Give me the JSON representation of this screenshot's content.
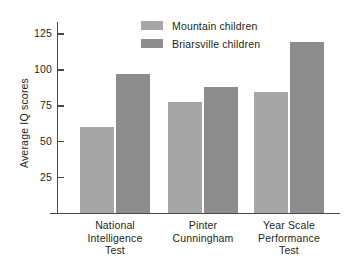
{
  "chart_data": {
    "type": "bar",
    "title": "",
    "subtitle": "",
    "xlabel": "",
    "ylabel": "Average IQ scores",
    "categories": [
      "National Intelligence Test",
      "Pinter Cunningham",
      "Year Scale Performance Test"
    ],
    "category_lines": [
      [
        "National",
        "Intelligence",
        "Test"
      ],
      [
        "Pinter",
        "Cunningham"
      ],
      [
        "Year Scale",
        "Performance",
        "Test"
      ]
    ],
    "series": [
      {
        "name": "Mountain children",
        "color": "#a6a6a6",
        "values": [
          60,
          77,
          84
        ]
      },
      {
        "name": "Briarsville children",
        "color": "#8d8d8d",
        "values": [
          97,
          88,
          119
        ]
      }
    ],
    "yticks": [
      25,
      50,
      75,
      100,
      125
    ],
    "ylim": [
      0,
      133
    ],
    "grid": false,
    "legend_position": "top-center",
    "axis_color": "#4a4a4a",
    "background": "#ffffff"
  }
}
